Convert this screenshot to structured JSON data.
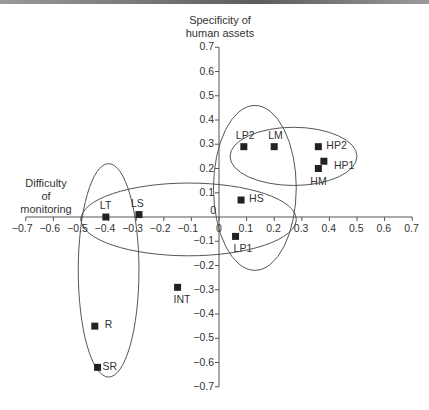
{
  "chart_data": {
    "type": "scatter",
    "title": "",
    "xlabel": "Difficulty of monitoring",
    "ylabel": "Specificity of human assets",
    "xlim": [
      -0.7,
      0.7
    ],
    "ylim": [
      -0.7,
      0.7
    ],
    "x_ticks": [
      "-0.7",
      "-0.6",
      "-0.5",
      "-0.4",
      "-0.3",
      "-0.2",
      "-0.1",
      "0",
      "0.1",
      "0.2",
      "0.3",
      "0.4",
      "0.5",
      "0.6",
      "0.7"
    ],
    "y_ticks": [
      "0.7",
      "0.6",
      "0.5",
      "0.4",
      "0.3",
      "0.2",
      "0.1",
      "0",
      "-0.1",
      "-0.2",
      "-0.3",
      "-0.4",
      "-0.5",
      "-0.6",
      "-0.7"
    ],
    "grid": false,
    "points": [
      {
        "label": "LP2",
        "x": 0.09,
        "y": 0.29
      },
      {
        "label": "LM",
        "x": 0.2,
        "y": 0.29
      },
      {
        "label": "HP2",
        "x": 0.36,
        "y": 0.29
      },
      {
        "label": "HP1",
        "x": 0.38,
        "y": 0.23
      },
      {
        "label": "HM",
        "x": 0.36,
        "y": 0.2
      },
      {
        "label": "HS",
        "x": 0.08,
        "y": 0.07
      },
      {
        "label": "LP1",
        "x": 0.06,
        "y": -0.08
      },
      {
        "label": "LT",
        "x": -0.41,
        "y": 0.0
      },
      {
        "label": "LS",
        "x": -0.29,
        "y": 0.01
      },
      {
        "label": "INT",
        "x": -0.15,
        "y": -0.29
      },
      {
        "label": "R",
        "x": -0.45,
        "y": -0.45
      },
      {
        "label": "SR",
        "x": -0.44,
        "y": -0.62
      }
    ],
    "annotations": [
      {
        "type": "ellipse",
        "description": "cluster L: LP2, LM, HS, LP1",
        "cx": 0.13,
        "cy": 0.12,
        "rx": 0.15,
        "ry": 0.34
      },
      {
        "type": "ellipse",
        "description": "cluster H: LP2, LM, HP2, HP1, HM",
        "cx": 0.27,
        "cy": 0.25,
        "rx": 0.23,
        "ry": 0.12
      },
      {
        "type": "ellipse",
        "description": "cluster horizontal: LT, LS, HS",
        "cx": -0.11,
        "cy": -0.01,
        "rx": 0.39,
        "ry": 0.15
      },
      {
        "type": "ellipse",
        "description": "cluster vertical: LT, LS, R, SR",
        "cx": -0.4,
        "cy": -0.22,
        "rx": 0.11,
        "ry": 0.44
      }
    ]
  },
  "labels": {
    "y_title_line1": "Specificity of",
    "y_title_line2": "human assets",
    "x_title_line1": "Difficulty",
    "x_title_line2": "of",
    "x_title_line3": "monitoring"
  }
}
